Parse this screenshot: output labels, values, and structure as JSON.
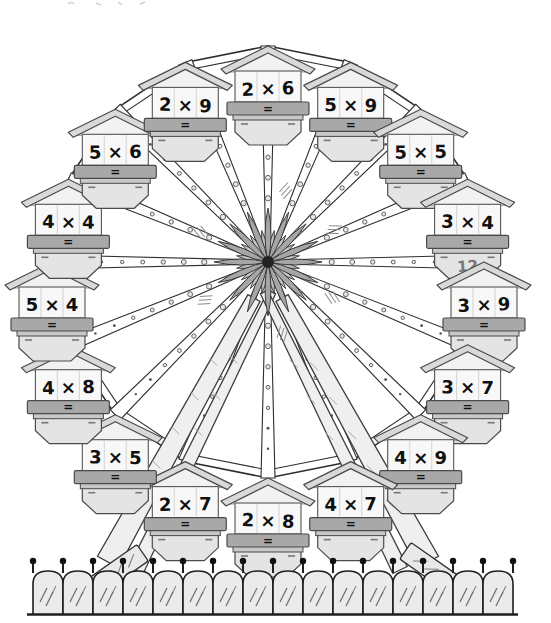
{
  "illustration": {
    "title_semantic": "ferris-wheel-multiplication-worksheet",
    "equals_label": "=",
    "cabins": [
      {
        "problem": "2 × 6",
        "answer": ""
      },
      {
        "problem": "5 × 9",
        "answer": ""
      },
      {
        "problem": "5 × 5",
        "answer": ""
      },
      {
        "problem": "3 × 4",
        "answer": "12"
      },
      {
        "problem": "3 × 9",
        "answer": ""
      },
      {
        "problem": "3 × 7",
        "answer": ""
      },
      {
        "problem": "4 × 9",
        "answer": ""
      },
      {
        "problem": "4 × 7",
        "answer": ""
      },
      {
        "problem": "2 × 8",
        "answer": ""
      },
      {
        "problem": "2 × 7",
        "answer": ""
      },
      {
        "problem": "3 × 5",
        "answer": ""
      },
      {
        "problem": "4 × 8",
        "answer": ""
      },
      {
        "problem": "5 × 4",
        "answer": ""
      },
      {
        "problem": "4 × 4",
        "answer": ""
      },
      {
        "problem": "5 × 6",
        "answer": ""
      },
      {
        "problem": "2 × 9",
        "answer": ""
      }
    ],
    "example_answer_note": "12",
    "colors": {
      "outline": "#2e2e2e",
      "roof_fill": "#d9d9d9",
      "gable_fill": "#f2f2f2",
      "body_fill": "#f8f8f8",
      "band_fill": "#a8a8a8",
      "basket_fill": "#e4e4e4",
      "basket_lip": "#c8c8c8",
      "problem_ink": "#101010",
      "answer_ink": "#787878",
      "fence_fill": "#ebebeb",
      "leg_fill": "#efefef",
      "hub_petal_long": "#a6a6a6",
      "hub_petal_short": "#c4c4c4",
      "page_background": "#ffffff"
    }
  }
}
